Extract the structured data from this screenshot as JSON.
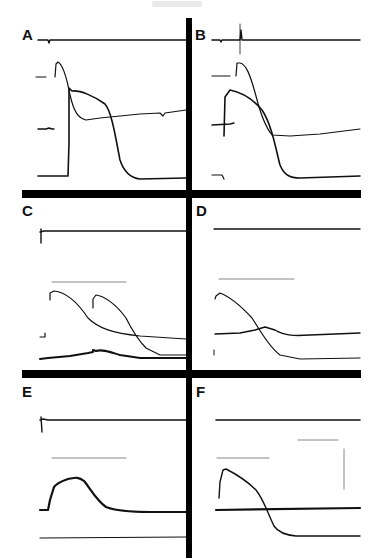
{
  "figure": {
    "panels": [
      {
        "id": "A",
        "label": "A",
        "x": 22,
        "y": 27
      },
      {
        "id": "B",
        "label": "B",
        "x": 195,
        "y": 27
      },
      {
        "id": "C",
        "label": "C",
        "x": 22,
        "y": 203
      },
      {
        "id": "D",
        "label": "D",
        "x": 196,
        "y": 203
      },
      {
        "id": "E",
        "label": "E",
        "x": 22,
        "y": 384
      },
      {
        "id": "F",
        "label": "F",
        "x": 196,
        "y": 384
      }
    ],
    "dividers": {
      "vertical": {
        "x": 186,
        "y": 18,
        "w": 6,
        "h": 540
      },
      "horizontal_1": {
        "x": 22,
        "y": 190,
        "w": 339,
        "h": 8
      },
      "horizontal_2": {
        "x": 22,
        "y": 370,
        "w": 339,
        "h": 8
      }
    },
    "colors": {
      "trace": "#111111",
      "scale_bar": "#888888",
      "divider": "#000000"
    },
    "traces": {
      "A": [
        {
          "name": "stimulus-trace",
          "w": 1.4,
          "d": "M38,40 L48,40 L49,43 L50,40 L186,40"
        },
        {
          "name": "baseline-marker",
          "w": 1,
          "d": "M36,77 L46,77"
        },
        {
          "name": "action-potential-1",
          "w": 1.2,
          "d": "M55,77 L56,64 L58,62 C62,64 66,74 70,95 C74,112 78,118 86,120 L100,118 L140,114 L160,113 L163,116 L165,113 L186,110"
        },
        {
          "name": "baseline-2",
          "w": 1.4,
          "d": "M38,129 L46,129 L49,128 L52,129 L54,129"
        },
        {
          "name": "action-potential-2",
          "w": 1.6,
          "d": "M38,176 L68,176 L69,143 L69,88 L72,91 C80,90 94,96 105,104 C112,112 116,140 120,160 C124,172 130,178 140,179 L186,178"
        }
      ],
      "B": [
        {
          "name": "stimulus-trace",
          "w": 1.4,
          "d": "M212,40 L220,40 L221,42 L222,40 L240,40 L241,30 L242,40 L360,40"
        },
        {
          "name": "scale-tick",
          "w": 0.8,
          "d": "M240,24 L240,54"
        },
        {
          "name": "baseline-marker",
          "w": 1,
          "d": "M212,76 L230,76"
        },
        {
          "name": "action-potential-1",
          "w": 1.2,
          "d": "M236,76 L237,63 L240,63 C246,64 250,74 256,96 C260,112 264,125 272,135 L290,136 L320,134 L360,129"
        },
        {
          "name": "baseline-2",
          "w": 1.4,
          "d": "M212,125 L230,124 L234,123"
        },
        {
          "name": "action-potential-2",
          "w": 1.6,
          "d": "M224,136 L225,97 L230,90 C240,92 252,98 262,110 C272,125 276,150 280,165 C284,175 290,178 300,178 L360,176"
        },
        {
          "name": "baseline-3",
          "w": 1.2,
          "d": "M212,175 L222,175 L224,179"
        }
      ],
      "C": [
        {
          "name": "stimulus-trace",
          "w": 1.4,
          "d": "M40,232 L44,231 L186,231 M41,229 L41,243"
        },
        {
          "name": "scale-bar",
          "w": 1,
          "scale": true,
          "d": "M52,282 L126,282"
        },
        {
          "name": "action-potential-1",
          "w": 1.2,
          "d": "M50,300 L50,293 L54,291 C64,292 76,300 88,318 C98,328 112,333 140,336 L186,339"
        },
        {
          "name": "action-potential-2",
          "w": 1.2,
          "d": "M93,308 L93,299 L96,295 C104,296 116,304 126,318 C132,330 138,340 146,348 L160,355 L186,355"
        },
        {
          "name": "baseline-marker",
          "w": 1.2,
          "d": "M40,337 L45,337 L45,333"
        },
        {
          "name": "calcium-trace",
          "w": 2,
          "d": "M40,359 L48,358 L70,356 L88,353 L93,352 L93,350 L96,351 C102,349 110,352 120,355 L140,358 L186,358"
        }
      ],
      "D": [
        {
          "name": "stimulus-trace",
          "w": 1.4,
          "d": "M214,229 L360,229"
        },
        {
          "name": "scale-bar",
          "w": 1,
          "scale": true,
          "d": "M219,279 L294,279"
        },
        {
          "name": "action-potential-1",
          "w": 1.2,
          "d": "M215,299 L216,296 L220,293 C228,296 240,305 252,318 C260,330 268,346 280,355 L300,359 L360,358"
        },
        {
          "name": "calcium-trace",
          "w": 1.4,
          "d": "M215,334 L240,333 L255,330 L265,327 L275,330 C285,336 295,336 310,335 L360,333"
        },
        {
          "name": "baseline-tick",
          "w": 1,
          "d": "M214,350 L214,355"
        }
      ],
      "E": [
        {
          "name": "stimulus-trace",
          "w": 1.4,
          "d": "M40,420 L43,419 L48,420 L186,420 M41,417 L42,432"
        },
        {
          "name": "scale-bar",
          "w": 1,
          "scale": true,
          "d": "M52,458 L126,458"
        },
        {
          "name": "calcium-transient",
          "w": 2.2,
          "d": "M40,510 L48,510 L50,500 L54,487 C58,482 62,481 68,479 C74,478 78,476 84,481 C90,488 96,500 106,507 C116,511 130,512 150,512 L186,512"
        },
        {
          "name": "baseline-2",
          "w": 1.2,
          "d": "M40,538 L186,537"
        }
      ],
      "F": [
        {
          "name": "stimulus-trace",
          "w": 1.6,
          "d": "M216,420 L360,420"
        },
        {
          "name": "scale-bar-horizontal-1",
          "w": 1,
          "scale": true,
          "d": "M298,440 L338,440"
        },
        {
          "name": "scale-bar-vertical",
          "w": 1,
          "scale": true,
          "d": "M344,449 L344,489"
        },
        {
          "name": "scale-bar-horizontal-2",
          "w": 1,
          "scale": true,
          "d": "M217,458 L269,458"
        },
        {
          "name": "action-potential",
          "w": 1.4,
          "d": "M219,498 L220,482 L223,470 L226,469 C234,473 246,480 256,490 C264,500 268,514 274,526 C278,532 284,535 296,536 L360,536"
        },
        {
          "name": "baseline-flat",
          "w": 2.2,
          "d": "M216,510 L360,508"
        }
      ]
    }
  }
}
